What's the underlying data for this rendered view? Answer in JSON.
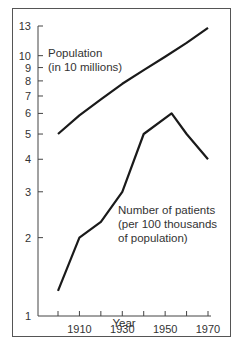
{
  "chart_data": {
    "type": "line",
    "title": "",
    "xlabel": "Year",
    "ylabel": "",
    "y_scale": "log",
    "ylim": [
      1,
      13
    ],
    "xlim": [
      1900,
      1970
    ],
    "grid": false,
    "legend": "inline annotations",
    "x_ticks": [
      1900,
      1910,
      1920,
      1930,
      1940,
      1950,
      1960,
      1970
    ],
    "x_tick_labels": [
      "1910",
      "1930",
      "1950",
      "1970"
    ],
    "y_ticks": [
      1,
      2,
      3,
      4,
      5,
      6,
      7,
      8,
      9,
      10,
      13
    ],
    "y_tick_labels": [
      "1",
      "2",
      "3",
      "4",
      "5",
      "6",
      "7",
      "8",
      "9",
      "10",
      "13"
    ],
    "series": [
      {
        "name": "Population (in 10 millions)",
        "label_lines": [
          "Population",
          "(in 10 millions)"
        ],
        "x": [
          1900,
          1910,
          1920,
          1930,
          1940,
          1950,
          1960,
          1970
        ],
        "values": [
          5.0,
          5.9,
          6.8,
          7.8,
          8.8,
          9.9,
          11.2,
          12.8
        ]
      },
      {
        "name": "Number of patients (per 100 thousands of population)",
        "label_lines": [
          "Number of patients",
          "(per 100 thousands",
          "of population)"
        ],
        "x": [
          1900,
          1910,
          1920,
          1930,
          1940,
          1953,
          1960,
          1970
        ],
        "values": [
          1.25,
          2.0,
          2.3,
          3.0,
          5.0,
          6.0,
          5.0,
          4.0
        ]
      }
    ]
  }
}
